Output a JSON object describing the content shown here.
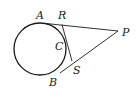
{
  "diagram": {
    "labels": {
      "A": "A",
      "R": "R",
      "P": "P",
      "C": "C",
      "S": "S",
      "B": "B"
    },
    "stroke_color": "#1a1a1a",
    "background": "#ffffff"
  }
}
